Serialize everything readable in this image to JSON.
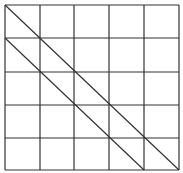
{
  "diagram": {
    "type": "grid-with-diagonals",
    "rows": 5,
    "cols": 5,
    "line_color": "#333333",
    "background": "#ffffff",
    "grid": {
      "x_lines": [
        5,
        40,
        74,
        109,
        144,
        179
      ],
      "y_lines": [
        5,
        38,
        72,
        105,
        138,
        170
      ]
    },
    "diagonals": [
      {
        "from": [
          5,
          5
        ],
        "to": [
          179,
          170
        ]
      },
      {
        "from": [
          5,
          38
        ],
        "to": [
          144,
          170
        ]
      }
    ]
  }
}
